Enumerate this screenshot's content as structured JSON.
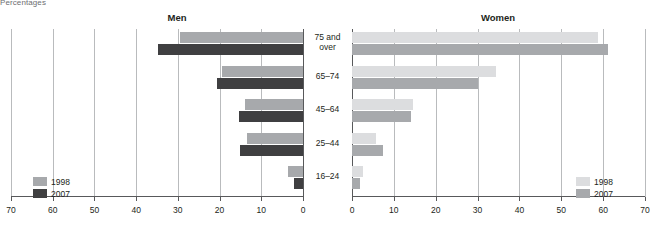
{
  "unit_note": "Percentages",
  "panels": {
    "men": {
      "title": "Men"
    },
    "women": {
      "title": "Women"
    }
  },
  "legend": {
    "series1_label": "1998",
    "series2_label": "2007"
  },
  "colors": {
    "men_1998": "#a7a9ac",
    "men_2007": "#3f3f41",
    "women_1998": "#dcdddf",
    "women_2007": "#a7a9ac",
    "gridline": "#b9bbbd",
    "axis": "#58595b"
  },
  "chart_data": {
    "type": "bar",
    "title": "Percentages",
    "orientation": "horizontal",
    "layout": "back-to-back paired panels",
    "grid": true,
    "legend_position": "inside lower-left (Men) and inside lower-right (Women)",
    "categories": [
      "75 and over",
      "65–74",
      "45–64",
      "25–44",
      "16–24"
    ],
    "panels": [
      {
        "name": "Men",
        "xlabel": "",
        "ylabel": "",
        "xlim": [
          70,
          0
        ],
        "direction": "right-to-left",
        "ticks": [
          70,
          60,
          50,
          40,
          30,
          20,
          10,
          0
        ],
        "series": [
          {
            "name": "1998",
            "values": [
              29.5,
              19.4,
              13.9,
              13.4,
              3.6
            ]
          },
          {
            "name": "2007",
            "values": [
              34.8,
              20.6,
              15.3,
              15.1,
              2.2
            ]
          }
        ]
      },
      {
        "name": "Women",
        "xlabel": "",
        "ylabel": "",
        "xlim": [
          0,
          70
        ],
        "direction": "left-to-right",
        "ticks": [
          0,
          10,
          20,
          30,
          40,
          50,
          60,
          70
        ],
        "series": [
          {
            "name": "1998",
            "values": [
              58.8,
              34.4,
              14.6,
              5.8,
              2.7
            ]
          },
          {
            "name": "2007",
            "values": [
              61.2,
              30.1,
              14.1,
              7.5,
              1.8
            ]
          }
        ]
      }
    ]
  }
}
